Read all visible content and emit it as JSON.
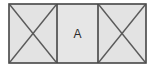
{
  "diagram": {
    "type": "panel-row",
    "canvas": {
      "width": 155,
      "height": 75
    },
    "outline": {
      "x": 9,
      "y": 4,
      "width": 137,
      "height": 59
    },
    "colors": {
      "background": "#ffffff",
      "panel_fill": "#e3e3e3",
      "panel_fill_middle": "#e6e6e6",
      "stroke": "#454545",
      "diagonal_stroke": "#5a5a5a",
      "label_text": "#2b2b2b"
    },
    "stroke_widths": {
      "outline": 1.6,
      "divider": 1.6,
      "diagonal": 1.4
    },
    "dividers": [
      {
        "name": "divider-left",
        "x": 57
      },
      {
        "name": "divider-right",
        "x": 98
      }
    ],
    "panels": [
      {
        "name": "panel-left",
        "x": 9,
        "y": 4,
        "width": 48,
        "height": 59,
        "fill": "#e3e3e3",
        "marking": "cross-diagonals",
        "label": ""
      },
      {
        "name": "panel-middle",
        "x": 57,
        "y": 4,
        "width": 41,
        "height": 59,
        "fill": "#e6e6e6",
        "marking": "none",
        "label": "A"
      },
      {
        "name": "panel-right",
        "x": 98,
        "y": 4,
        "width": 48,
        "height": 59,
        "fill": "#e3e3e3",
        "marking": "cross-diagonals",
        "label": ""
      }
    ],
    "labels": {
      "middle_panel": "A"
    }
  }
}
